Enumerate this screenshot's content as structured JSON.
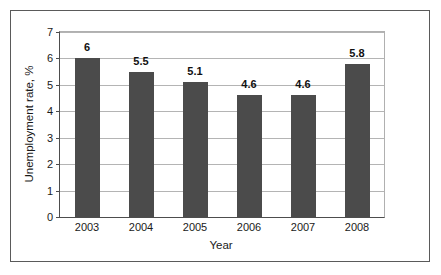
{
  "chart_data": {
    "type": "bar",
    "title": "",
    "categories": [
      "2003",
      "2004",
      "2005",
      "2006",
      "2007",
      "2008"
    ],
    "values": [
      6,
      5.5,
      5.1,
      4.6,
      4.6,
      5.8
    ],
    "data_labels": [
      "6",
      "5.5",
      "5.1",
      "4.6",
      "4.6",
      "5.8"
    ],
    "xlabel": "Year",
    "ylabel": "Unemployment rate, %",
    "ylim": [
      0,
      7
    ],
    "ytick_labels": [
      "0",
      "1",
      "2",
      "3",
      "4",
      "5",
      "6",
      "7"
    ],
    "ytick_values": [
      0,
      1,
      2,
      3,
      4,
      5,
      6,
      7
    ],
    "grid": "horizontal",
    "legend": "none",
    "bar_color": "#4b4b4b",
    "gridline_color": "#b4b4b4",
    "axis_color": "#4d4d4d",
    "background_color": "#ffffff"
  }
}
